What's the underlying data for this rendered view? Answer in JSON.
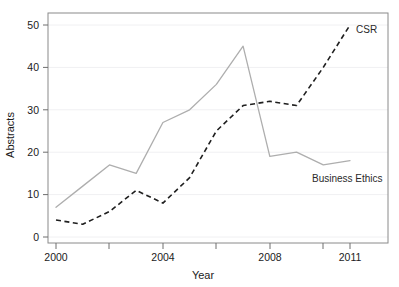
{
  "chart_data": {
    "type": "line",
    "title": "",
    "xlabel": "Year",
    "ylabel": "Abstracts",
    "xlim": [
      2000,
      2012
    ],
    "ylim": [
      0,
      52
    ],
    "x": [
      2000,
      2001,
      2002,
      2003,
      2004,
      2005,
      2006,
      2007,
      2008,
      2009,
      2010,
      2011
    ],
    "xtick_values": [
      2000,
      2002,
      2004,
      2006,
      2008,
      2010,
      2011
    ],
    "xtick_labels": [
      "2000",
      "",
      "2004",
      "",
      "2008",
      "",
      "2011"
    ],
    "ytick_values": [
      0,
      10,
      20,
      30,
      40,
      50
    ],
    "ytick_labels": [
      "0",
      "10",
      "20",
      "30",
      "40",
      "50"
    ],
    "grid": "horizontal-faint",
    "legend_position": "inline-annotations",
    "series": [
      {
        "name": "Business Ethics",
        "style": "solid",
        "color": "#aeaeae",
        "label_text": "Business Ethics",
        "values": [
          7,
          12,
          17,
          15,
          27,
          30,
          36,
          45,
          19,
          20,
          17,
          18
        ]
      },
      {
        "name": "CSR",
        "style": "dashed",
        "color": "#1f1f1f",
        "label_text": "CSR",
        "values": [
          4,
          3,
          6,
          11,
          8,
          14,
          25,
          31,
          32,
          31,
          40,
          50
        ]
      }
    ]
  },
  "axes": {
    "x_title": "Year",
    "y_title": "Abstracts"
  },
  "annotations": {
    "csr": "CSR",
    "business_ethics": "Business Ethics"
  }
}
